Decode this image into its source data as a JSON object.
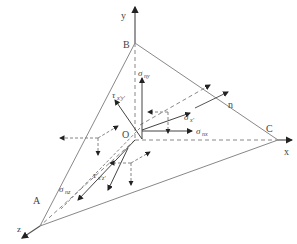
{
  "diagram": {
    "points": {
      "origin": "O",
      "a": "A",
      "b": "B",
      "c": "C"
    },
    "axes": {
      "x": "x",
      "y": "y",
      "z": "z"
    },
    "normal": "n",
    "stress_labels": {
      "sigma_ny": {
        "sym": "σ",
        "sub": "ny"
      },
      "tau_xy": {
        "sym": "τ",
        "sub": "x'y'"
      },
      "sigma_x": {
        "sym": "σ",
        "sub": "x'"
      },
      "sigma_nx": {
        "sym": "σ",
        "sub": "nx"
      },
      "sigma_nz": {
        "sym": "σ",
        "sub": "nz"
      },
      "tau_xz": {
        "sym": "τ",
        "sub": "x'z'"
      }
    },
    "colors": {
      "line": "#777777",
      "arrow": "#222222",
      "text": "#444444"
    }
  }
}
